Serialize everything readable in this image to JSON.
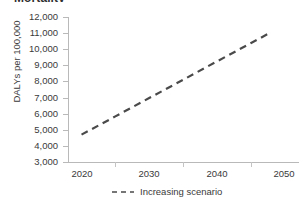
{
  "figure": {
    "title_fragment": "Mortality",
    "background_color": "#ffffff"
  },
  "chart_data": {
    "type": "line",
    "title": "",
    "xlabel": "",
    "ylabel": "DALYs per 100,000",
    "xlim": [
      2018,
      2052
    ],
    "ylim": [
      3000,
      12000
    ],
    "grid": false,
    "legend_position": "bottom",
    "x_tick_labels": [
      "2020",
      "2030",
      "2040",
      "2050"
    ],
    "x_tick_values": [
      2020,
      2030,
      2040,
      2050
    ],
    "y_tick_labels": [
      "12,000",
      "11,000",
      "10,000",
      "9,000",
      "8,000",
      "7,000",
      "6,000",
      "5,000",
      "4,000",
      "3,000"
    ],
    "y_tick_values": [
      12000,
      11000,
      10000,
      9000,
      8000,
      7000,
      6000,
      5000,
      4000,
      3000
    ],
    "series": [
      {
        "name": "Increasing scenario",
        "linestyle": "dashed",
        "color": "#4a4a4a",
        "x": [
          2020,
          2025,
          2030,
          2035,
          2040,
          2045,
          2048
        ],
        "values": [
          4700,
          5830,
          6970,
          8100,
          9240,
          10370,
          11050
        ]
      }
    ]
  },
  "legend": {
    "entries": [
      {
        "label": "Increasing scenario",
        "color": "#4a4a4a"
      }
    ]
  }
}
